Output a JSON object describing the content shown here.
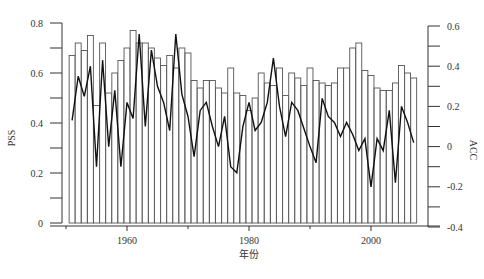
{
  "chart_data": {
    "type": "bar+line",
    "title": "",
    "xlabel": "年份",
    "ylabel_left": "PSS",
    "ylabel_right": "ACC",
    "x_ticks": [
      1960,
      1980,
      2000
    ],
    "y_left_ticks": [
      0,
      0.2,
      0.4,
      0.6,
      0.8
    ],
    "y_left_tick_labels": [
      "0",
      "0.2",
      "0.4",
      "0.6",
      "0.8"
    ],
    "y_right_ticks": [
      -0.4,
      -0.2,
      0,
      0.2,
      0.4,
      0.6
    ],
    "y_right_tick_labels": [
      "-0.4",
      "-0.2",
      "0",
      "0.2",
      "0.4",
      "0.6"
    ],
    "ylim_left": [
      0,
      0.8
    ],
    "ylim_right": [
      -0.4,
      0.6
    ],
    "xlim": [
      1949.3,
      2008.7
    ],
    "grid": false,
    "legend": null,
    "x": [
      1951,
      1952,
      1953,
      1954,
      1955,
      1956,
      1957,
      1958,
      1959,
      1960,
      1961,
      1962,
      1963,
      1964,
      1965,
      1966,
      1967,
      1968,
      1969,
      1970,
      1971,
      1972,
      1973,
      1974,
      1975,
      1976,
      1977,
      1978,
      1979,
      1980,
      1981,
      1982,
      1983,
      1984,
      1985,
      1986,
      1987,
      1988,
      1989,
      1990,
      1991,
      1992,
      1993,
      1994,
      1995,
      1996,
      1997,
      1998,
      1999,
      2000,
      2001,
      2002,
      2003,
      2004,
      2005,
      2006,
      2007
    ],
    "series": [
      {
        "name": "PSS",
        "axis": "left",
        "type": "bar",
        "values": [
          0.67,
          0.72,
          0.69,
          0.75,
          0.47,
          0.72,
          0.52,
          0.6,
          0.65,
          0.7,
          0.77,
          0.72,
          0.72,
          0.7,
          0.66,
          0.63,
          0.67,
          0.62,
          0.7,
          0.68,
          0.57,
          0.54,
          0.57,
          0.57,
          0.54,
          0.52,
          0.62,
          0.52,
          0.51,
          0.45,
          0.5,
          0.6,
          0.56,
          0.55,
          0.62,
          0.51,
          0.6,
          0.58,
          0.55,
          0.62,
          0.57,
          0.56,
          0.55,
          0.56,
          0.62,
          0.62,
          0.7,
          0.72,
          0.61,
          0.59,
          0.54,
          0.53,
          0.53,
          0.56,
          0.63,
          0.6,
          0.58
        ],
        "color": "#ffffff",
        "edgecolor": "#555555"
      },
      {
        "name": "ACC",
        "axis": "right",
        "type": "line",
        "values": [
          0.13,
          0.35,
          0.25,
          0.4,
          -0.1,
          0.43,
          0.0,
          0.28,
          -0.1,
          0.22,
          0.14,
          0.56,
          0.1,
          0.48,
          0.3,
          0.22,
          0.08,
          0.56,
          0.26,
          0.15,
          -0.05,
          0.18,
          0.22,
          0.1,
          0.0,
          0.15,
          -0.1,
          -0.13,
          0.1,
          0.22,
          0.08,
          0.12,
          0.22,
          0.44,
          0.2,
          0.05,
          0.22,
          0.18,
          0.09,
          0.0,
          -0.08,
          0.24,
          0.15,
          0.12,
          0.05,
          0.12,
          0.06,
          -0.02,
          0.04,
          -0.2,
          0.04,
          -0.02,
          0.18,
          -0.18,
          0.2,
          0.12,
          0.02
        ],
        "color": "#111111"
      }
    ]
  }
}
